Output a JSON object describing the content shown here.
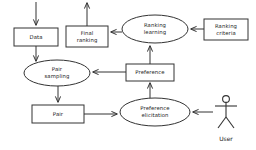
{
  "diagram": {
    "type": "flowchart",
    "background_color": "#ffffff",
    "stroke_color": "#333333",
    "text_color": "#1a1a1a",
    "nodes": [
      {
        "id": "data",
        "label": "Data",
        "shape": "rectangle",
        "x": 14,
        "y": 28,
        "width": 44,
        "height": 18
      },
      {
        "id": "final_ranking",
        "label_line1": "Final",
        "label_line2": "ranking",
        "shape": "rectangle",
        "x": 66,
        "y": 26,
        "width": 42,
        "height": 21
      },
      {
        "id": "ranking_learning",
        "label_line1": "Ranking",
        "label_line2": "learning",
        "shape": "ellipse",
        "cx": 155,
        "cy": 29,
        "rx": 33,
        "ry": 14
      },
      {
        "id": "ranking_criteria",
        "label_line1": "Ranking",
        "label_line2": "criteria",
        "shape": "rectangle",
        "x": 204,
        "y": 19,
        "width": 44,
        "height": 21
      },
      {
        "id": "pair_sampling",
        "label_line1": "Pair",
        "label_line2": "sampling",
        "shape": "ellipse",
        "cx": 57,
        "cy": 73,
        "rx": 33,
        "ry": 13
      },
      {
        "id": "preference",
        "label": "Preference",
        "shape": "rectangle",
        "x": 126,
        "y": 64,
        "width": 48,
        "height": 17
      },
      {
        "id": "pair",
        "label": "Pair",
        "shape": "rectangle",
        "x": 32,
        "y": 105,
        "width": 52,
        "height": 18
      },
      {
        "id": "preference_elicitation",
        "label_line1": "Preference",
        "label_line2": "elicitation",
        "shape": "ellipse",
        "cx": 155,
        "cy": 112,
        "rx": 35,
        "ry": 14
      },
      {
        "id": "user",
        "label": "User",
        "shape": "actor",
        "cx": 226,
        "cy": 112
      }
    ],
    "edges": [
      {
        "id": "edge-input-to-data",
        "from": "external-input",
        "to": "data",
        "direction": "down"
      },
      {
        "id": "edge-data-to-pair-sampling",
        "from": "data",
        "to": "pair_sampling",
        "direction": "down"
      },
      {
        "id": "edge-final-ranking-to-output",
        "from": "final_ranking",
        "to": "external-output",
        "direction": "up"
      },
      {
        "id": "edge-ranking-learning-to-final-ranking",
        "from": "ranking_learning",
        "to": "final_ranking",
        "direction": "left"
      },
      {
        "id": "edge-ranking-criteria-to-ranking-learning",
        "from": "ranking_criteria",
        "to": "ranking_learning",
        "direction": "left"
      },
      {
        "id": "edge-preference-to-ranking-learning",
        "from": "preference",
        "to": "ranking_learning",
        "direction": "up"
      },
      {
        "id": "edge-preference-to-pair-sampling",
        "from": "preference",
        "to": "pair_sampling",
        "direction": "left"
      },
      {
        "id": "edge-pair-sampling-to-pair",
        "from": "pair_sampling",
        "to": "pair",
        "direction": "down"
      },
      {
        "id": "edge-pair-to-preference-elicitation",
        "from": "pair",
        "to": "preference_elicitation",
        "direction": "right"
      },
      {
        "id": "edge-preference-elicitation-to-preference",
        "from": "preference_elicitation",
        "to": "preference",
        "direction": "up"
      },
      {
        "id": "edge-user-to-preference-elicitation",
        "from": "user",
        "to": "preference_elicitation",
        "direction": "left"
      }
    ]
  }
}
